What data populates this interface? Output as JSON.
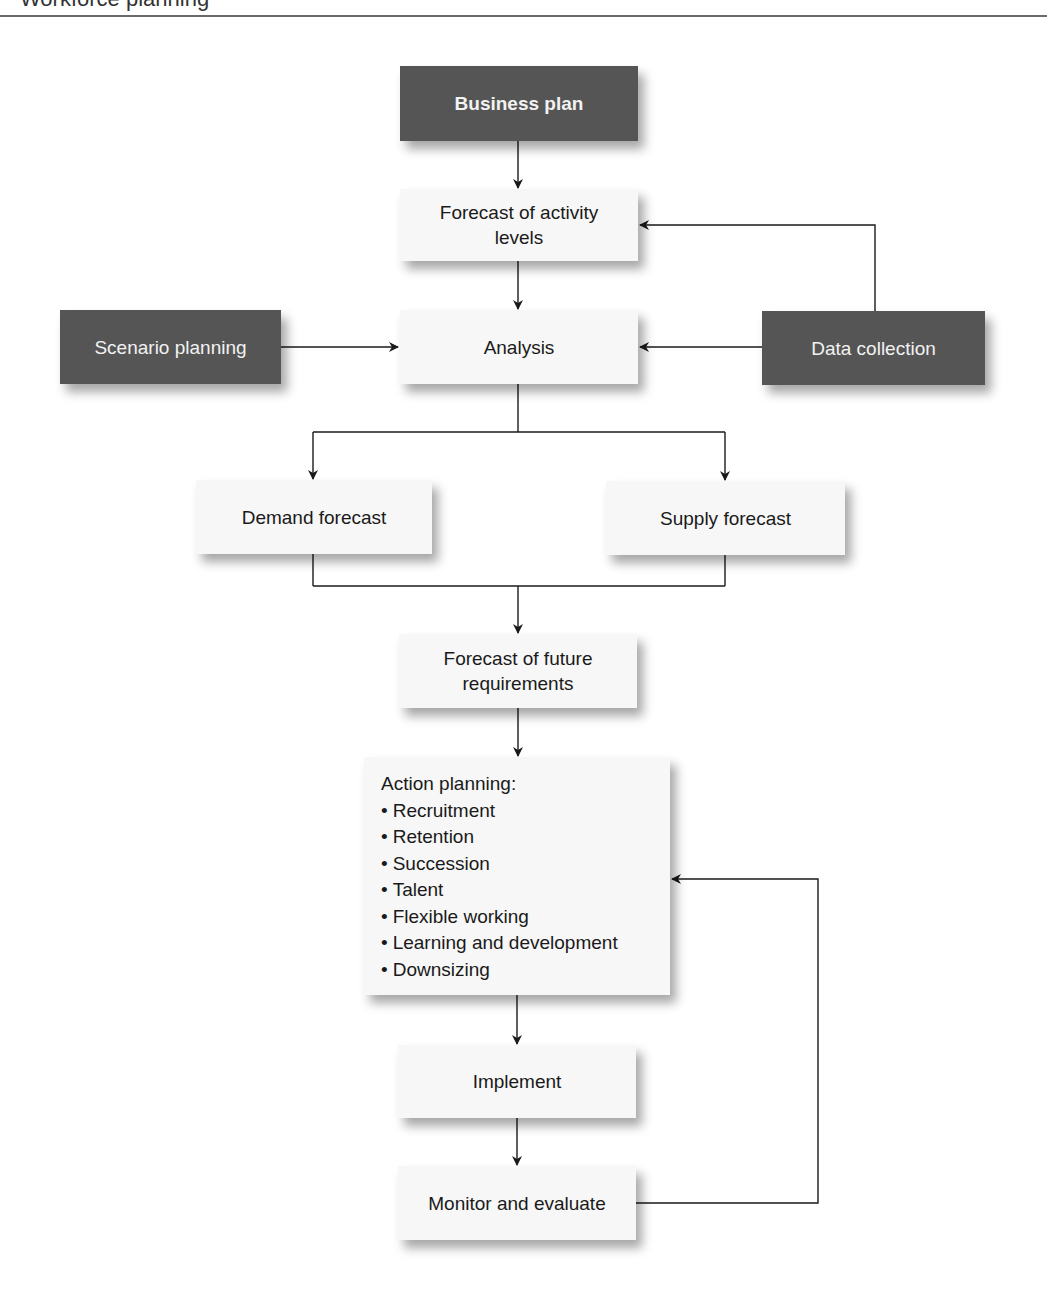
{
  "header": {
    "text": "Workforce planning"
  },
  "colors": {
    "dark_box": "#555555",
    "light_box": "#f7f7f7",
    "line": "#1a1a1a"
  },
  "nodes": {
    "business_plan": "Business plan",
    "forecast_activity": "Forecast of activity levels",
    "scenario_planning": "Scenario planning",
    "analysis": "Analysis",
    "data_collection": "Data collection",
    "demand_forecast": "Demand forecast",
    "supply_forecast": "Supply forecast",
    "forecast_future": "Forecast of future requirements",
    "action_planning": {
      "title": "Action planning:",
      "items": [
        "Recruitment",
        "Retention",
        "Succession",
        "Talent",
        "Flexible working",
        "Learning and development",
        "Downsizing"
      ]
    },
    "implement": "Implement",
    "monitor": "Monitor and evaluate"
  },
  "edges": [
    {
      "from": "Business plan",
      "to": "Forecast of activity levels"
    },
    {
      "from": "Data collection",
      "to": "Forecast of activity levels"
    },
    {
      "from": "Forecast of activity levels",
      "to": "Analysis"
    },
    {
      "from": "Scenario planning",
      "to": "Analysis"
    },
    {
      "from": "Data collection",
      "to": "Analysis"
    },
    {
      "from": "Analysis",
      "to": "Demand forecast"
    },
    {
      "from": "Analysis",
      "to": "Supply forecast"
    },
    {
      "from": "Demand forecast",
      "to": "Forecast of future requirements"
    },
    {
      "from": "Supply forecast",
      "to": "Forecast of future requirements"
    },
    {
      "from": "Forecast of future requirements",
      "to": "Action planning"
    },
    {
      "from": "Action planning",
      "to": "Implement"
    },
    {
      "from": "Implement",
      "to": "Monitor and evaluate"
    },
    {
      "from": "Monitor and evaluate",
      "to": "Action planning"
    }
  ]
}
